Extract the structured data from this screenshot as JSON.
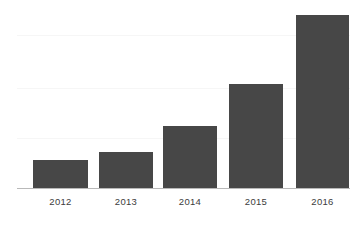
{
  "chart_data": {
    "type": "bar",
    "title": "",
    "subtitle": "",
    "xlabel": "",
    "ylabel": "",
    "categories": [
      "2012",
      "2013",
      "2014",
      "2015",
      "2016"
    ],
    "values": [
      16,
      21,
      36,
      60,
      100
    ],
    "ylim": [
      0,
      107
    ],
    "grid": true,
    "gridlines": [
      80,
      51,
      22
    ],
    "legend": null,
    "legend_position": "none",
    "annotations": [],
    "series": [
      {
        "name": "",
        "values": [
          16,
          21,
          36,
          60,
          100
        ],
        "color": "#474747"
      }
    ]
  },
  "style": {
    "bar_color": "#474747",
    "axis_color": "#b9b9b9",
    "grid_color": "#f6f6f6",
    "label_color": "#3c3c3c",
    "background": "#ffffff"
  }
}
